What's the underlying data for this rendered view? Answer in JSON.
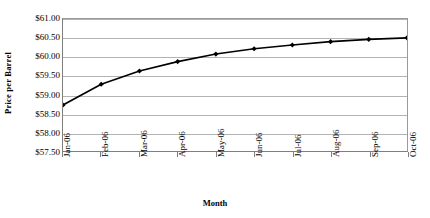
{
  "chart_data": {
    "type": "line",
    "title": "",
    "xlabel": "Month",
    "ylabel": "Price per Barrel",
    "categories": [
      "Jan-06",
      "Feb-06",
      "Mar-06",
      "Apr-06",
      "May-06",
      "Jun-06",
      "Jul-06",
      "Aug-06",
      "Sep-06",
      "Oct-06"
    ],
    "values": [
      58.72,
      59.27,
      59.62,
      59.87,
      60.07,
      60.21,
      60.31,
      60.4,
      60.46,
      60.5
    ],
    "series": [
      {
        "name": "Price per Barrel",
        "values": [
          58.72,
          59.27,
          59.62,
          59.87,
          60.07,
          60.21,
          60.31,
          60.4,
          60.46,
          60.5
        ]
      }
    ],
    "ylim": [
      57.5,
      61.0
    ],
    "ytick_values": [
      57.5,
      58.0,
      58.5,
      59.0,
      59.5,
      60.0,
      60.5,
      61.0
    ],
    "ytick_labels": [
      "$57.50",
      "$58.00",
      "$58.50",
      "$59.00",
      "$59.50",
      "$60.00",
      "$60.50",
      "$61.00"
    ],
    "grid": true,
    "legend": false,
    "marker": "diamond",
    "line_color": "#000000",
    "marker_color": "#000000",
    "grid_color": "#b3b3b3",
    "axis_color": "#7f7f7f",
    "background_color": "#ffffff"
  },
  "axes": {
    "y_title": "Price per Barrel",
    "x_title": "Month"
  }
}
